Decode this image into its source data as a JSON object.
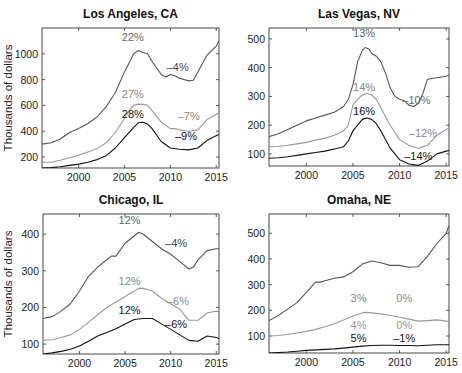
{
  "chart_data": [
    {
      "type": "line",
      "title": "Los Angeles, CA",
      "xlabel": "",
      "ylabel": "Thousands of dollars",
      "xlim": [
        1996,
        2015.3
      ],
      "ylim": [
        115,
        1200
      ],
      "xticks": [
        2000,
        2005,
        2010,
        2015
      ],
      "yticks": [
        200,
        400,
        600,
        800,
        1000
      ],
      "grid": false,
      "frame": {
        "x0": 42,
        "x1": 219,
        "y0": 28,
        "y1": 168
      },
      "series": [
        {
          "name": "top tier",
          "color": "#555555",
          "x": [
            1996,
            1997,
            1998,
            1999,
            2000,
            2001,
            2002,
            2003,
            2004,
            2005,
            2006,
            2006.5,
            2007,
            2007.5,
            2008,
            2009,
            2009.5,
            2010,
            2010.5,
            2011,
            2012,
            2012.5,
            2013,
            2014,
            2015,
            2015.3
          ],
          "y": [
            300,
            310,
            340,
            390,
            420,
            460,
            510,
            590,
            700,
            860,
            1000,
            1025,
            1010,
            1000,
            940,
            840,
            820,
            840,
            830,
            810,
            790,
            795,
            860,
            990,
            1060,
            1100
          ]
        },
        {
          "name": "middle tier",
          "color": "#999999",
          "x": [
            1996,
            1997,
            1998,
            1999,
            2000,
            2001,
            2002,
            2003,
            2004,
            2005,
            2005.5,
            2006,
            2006.5,
            2007,
            2007.5,
            2008,
            2009,
            2010,
            2010.5,
            2011,
            2012,
            2013,
            2014,
            2015,
            2015.3
          ],
          "y": [
            160,
            160,
            175,
            195,
            215,
            240,
            265,
            310,
            390,
            500,
            560,
            600,
            610,
            608,
            600,
            560,
            470,
            420,
            420,
            410,
            400,
            410,
            490,
            530,
            545
          ]
        },
        {
          "name": "bottom tier",
          "color": "#111111",
          "x": [
            1996,
            1997,
            1998,
            1999,
            2000,
            2001,
            2002,
            2003,
            2004,
            2005,
            2006,
            2006.5,
            2007,
            2007.5,
            2008,
            2009,
            2010,
            2011,
            2012,
            2013,
            2014,
            2015,
            2015.3
          ],
          "y": [
            115,
            118,
            125,
            135,
            145,
            160,
            180,
            210,
            270,
            350,
            430,
            465,
            470,
            455,
            420,
            320,
            270,
            260,
            255,
            270,
            330,
            365,
            375
          ]
        }
      ],
      "annotations": [
        {
          "text": "22%",
          "x": 2005.9,
          "y": 1100,
          "color": "#666666"
        },
        {
          "text": "–4%",
          "x": 2010.8,
          "y": 870,
          "color": "#444444"
        },
        {
          "text": "27%",
          "x": 2005.9,
          "y": 660,
          "color": "#888888"
        },
        {
          "text": "–7%",
          "x": 2012,
          "y": 490,
          "color": "#888888"
        },
        {
          "text": "28%",
          "x": 2005.9,
          "y": 505,
          "color": "#111111"
        },
        {
          "text": "–9%",
          "x": 2011.7,
          "y": 330,
          "color": "#111111"
        }
      ]
    },
    {
      "type": "line",
      "title": "Las Vegas, NV",
      "xlabel": "",
      "ylabel": "",
      "xlim": [
        1996,
        2015.3
      ],
      "ylim": [
        58,
        538
      ],
      "xticks": [
        2000,
        2005,
        2010,
        2015
      ],
      "yticks": [
        100,
        200,
        300,
        400,
        500
      ],
      "grid": false,
      "frame": {
        "x0": 269,
        "x1": 449,
        "y0": 28,
        "y1": 166
      },
      "series": [
        {
          "name": "top tier",
          "color": "#555555",
          "x": [
            1996,
            1997,
            1998,
            1999,
            2000,
            2001,
            2002,
            2003,
            2004,
            2004.5,
            2005,
            2005.5,
            2006,
            2006.3,
            2006.7,
            2007,
            2007.5,
            2008,
            2008.5,
            2009,
            2009.5,
            2010,
            2010.5,
            2011,
            2011.5,
            2012,
            2012.5,
            2013,
            2014,
            2015,
            2015.3
          ],
          "y": [
            160,
            170,
            185,
            200,
            215,
            225,
            235,
            245,
            265,
            290,
            340,
            420,
            460,
            470,
            465,
            450,
            440,
            420,
            380,
            330,
            300,
            290,
            285,
            270,
            265,
            275,
            310,
            360,
            365,
            370,
            375
          ]
        },
        {
          "name": "middle tier",
          "color": "#999999",
          "x": [
            1996,
            1997,
            1998,
            1999,
            2000,
            2001,
            2002,
            2003,
            2004,
            2004.5,
            2005,
            2005.5,
            2006,
            2006.5,
            2007,
            2007.5,
            2008,
            2009,
            2010,
            2011,
            2012,
            2013,
            2014,
            2015,
            2015.3
          ],
          "y": [
            125,
            127,
            130,
            135,
            140,
            148,
            155,
            165,
            180,
            200,
            270,
            290,
            305,
            310,
            305,
            290,
            260,
            200,
            150,
            130,
            120,
            130,
            165,
            185,
            190
          ]
        },
        {
          "name": "bottom tier",
          "color": "#111111",
          "x": [
            1996,
            1997,
            1998,
            1999,
            2000,
            2001,
            2002,
            2003,
            2004,
            2004.5,
            2005,
            2005.5,
            2006,
            2006.5,
            2007,
            2007.5,
            2008,
            2009,
            2010,
            2011,
            2012,
            2013,
            2014,
            2015,
            2015.3
          ],
          "y": [
            85,
            87,
            90,
            95,
            100,
            105,
            110,
            117,
            125,
            145,
            180,
            200,
            220,
            225,
            220,
            205,
            180,
            120,
            80,
            65,
            60,
            75,
            100,
            110,
            112
          ]
        }
      ],
      "annotations": [
        {
          "text": "13%",
          "x": 2006.2,
          "y": 505,
          "color": "#666666"
        },
        {
          "text": "–10%",
          "x": 2011.8,
          "y": 272,
          "color": "#666666"
        },
        {
          "text": "14%",
          "x": 2006.2,
          "y": 320,
          "color": "#888888"
        },
        {
          "text": "–12%",
          "x": 2012.5,
          "y": 158,
          "color": "#888888"
        },
        {
          "text": "16%",
          "x": 2006.2,
          "y": 235,
          "color": "#111111"
        },
        {
          "text": "–14%",
          "x": 2012,
          "y": 80,
          "color": "#111111"
        }
      ]
    },
    {
      "type": "line",
      "title": "Chicago, IL",
      "xlabel": "",
      "ylabel": "Thousands of dollars",
      "xlim": [
        1996,
        2015.3
      ],
      "ylim": [
        73,
        455
      ],
      "xticks": [
        2000,
        2005,
        2010,
        2015
      ],
      "yticks": [
        100,
        200,
        300,
        400
      ],
      "grid": false,
      "frame": {
        "x0": 43,
        "x1": 219,
        "y0": 214,
        "y1": 354
      },
      "series": [
        {
          "name": "top tier",
          "color": "#555555",
          "x": [
            1996,
            1997,
            1998,
            1999,
            2000,
            2001,
            2002,
            2003,
            2003.5,
            2004,
            2005,
            2006,
            2006.5,
            2007,
            2008,
            2009,
            2010,
            2011,
            2012,
            2012.5,
            2013,
            2014,
            2015,
            2015.3
          ],
          "y": [
            170,
            175,
            190,
            210,
            245,
            285,
            310,
            330,
            340,
            340,
            375,
            395,
            405,
            400,
            380,
            360,
            345,
            325,
            305,
            310,
            330,
            355,
            360,
            360
          ]
        },
        {
          "name": "middle tier",
          "color": "#999999",
          "x": [
            1996,
            1997,
            1998,
            1999,
            2000,
            2001,
            2002,
            2003,
            2004,
            2005,
            2006,
            2006.5,
            2007,
            2008,
            2009,
            2010,
            2011,
            2012,
            2013,
            2014,
            2015,
            2015.3
          ],
          "y": [
            110,
            112,
            118,
            125,
            140,
            160,
            180,
            200,
            215,
            230,
            245,
            252,
            252,
            245,
            225,
            210,
            195,
            165,
            165,
            185,
            190,
            188
          ]
        },
        {
          "name": "bottom tier",
          "color": "#111111",
          "x": [
            1996,
            1997,
            1998,
            1999,
            2000,
            2001,
            2002,
            2003,
            2004,
            2005,
            2006,
            2007,
            2008,
            2009,
            2010,
            2011,
            2012,
            2013,
            2014,
            2015,
            2015.3
          ],
          "y": [
            73,
            76,
            80,
            86,
            95,
            108,
            122,
            132,
            142,
            155,
            167,
            170,
            170,
            155,
            140,
            125,
            110,
            108,
            122,
            118,
            115
          ]
        }
      ],
      "annotations": [
        {
          "text": "12%",
          "x": 2005.5,
          "y": 427,
          "color": "#666666"
        },
        {
          "text": "–4%",
          "x": 2010.6,
          "y": 365,
          "color": "#444444"
        },
        {
          "text": "12%",
          "x": 2005.5,
          "y": 262,
          "color": "#888888"
        },
        {
          "text": "–6%",
          "x": 2010.8,
          "y": 208,
          "color": "#888888"
        },
        {
          "text": "12%",
          "x": 2005.5,
          "y": 183,
          "color": "#111111"
        },
        {
          "text": "–6%",
          "x": 2010.6,
          "y": 145,
          "color": "#111111"
        }
      ]
    },
    {
      "type": "line",
      "title": "Omaha, NE",
      "xlabel": "",
      "ylabel": "",
      "xlim": [
        1996,
        2015.3
      ],
      "ylim": [
        34,
        575
      ],
      "xticks": [
        2000,
        2005,
        2010,
        2015
      ],
      "yticks": [
        100,
        200,
        300,
        400,
        500
      ],
      "grid": false,
      "frame": {
        "x0": 269,
        "x1": 449,
        "y0": 214,
        "y1": 353
      },
      "series": [
        {
          "name": "top tier",
          "color": "#555555",
          "x": [
            1996,
            1997,
            1998,
            1999,
            2000,
            2001,
            2001.5,
            2002,
            2003,
            2004,
            2005,
            2006,
            2007,
            2008,
            2009,
            2010,
            2011,
            2012,
            2013,
            2014,
            2015,
            2015.3
          ],
          "y": [
            160,
            180,
            205,
            230,
            270,
            310,
            310,
            315,
            325,
            330,
            350,
            380,
            392,
            385,
            375,
            375,
            368,
            370,
            410,
            460,
            500,
            530
          ]
        },
        {
          "name": "middle tier",
          "color": "#999999",
          "x": [
            1996,
            1997,
            1998,
            1999,
            2000,
            2001,
            2002,
            2003,
            2004,
            2005,
            2006,
            2006.5,
            2007,
            2008,
            2009,
            2010,
            2011,
            2012,
            2013,
            2014,
            2015,
            2015.3
          ],
          "y": [
            100,
            102,
            106,
            112,
            118,
            126,
            136,
            148,
            162,
            178,
            190,
            192,
            190,
            186,
            180,
            173,
            166,
            158,
            160,
            163,
            158,
            156
          ]
        },
        {
          "name": "bottom tier",
          "color": "#111111",
          "x": [
            1996,
            1997,
            1998,
            1999,
            2000,
            2001,
            2002,
            2003,
            2004,
            2005,
            2006,
            2007,
            2008,
            2009,
            2010,
            2011,
            2012,
            2013,
            2014,
            2015,
            2015.3
          ],
          "y": [
            34,
            36,
            38,
            41,
            44,
            46,
            48,
            50,
            53,
            57,
            61,
            63,
            64,
            64,
            63,
            63,
            62,
            64,
            66,
            66,
            66
          ]
        }
      ],
      "annotations": [
        {
          "text": "3%",
          "x": 2005.6,
          "y": 232,
          "color": "#888888"
        },
        {
          "text": "0%",
          "x": 2010.5,
          "y": 232,
          "color": "#888888"
        },
        {
          "text": "4%",
          "x": 2005.6,
          "y": 127,
          "color": "#999999"
        },
        {
          "text": "0%",
          "x": 2010.5,
          "y": 127,
          "color": "#999999"
        },
        {
          "text": "5%",
          "x": 2005.6,
          "y": 75,
          "color": "#111111"
        },
        {
          "text": "–1%",
          "x": 2010.5,
          "y": 75,
          "color": "#111111"
        }
      ]
    }
  ],
  "panels": {
    "la": {
      "title": "Los Angeles, CA",
      "ylabel": "Thousands of dollars"
    },
    "lv": {
      "title": "Las Vegas, NV"
    },
    "chi": {
      "title": "Chicago, IL",
      "ylabel": "Thousands of dollars"
    },
    "oma": {
      "title": "Omaha, NE"
    }
  }
}
